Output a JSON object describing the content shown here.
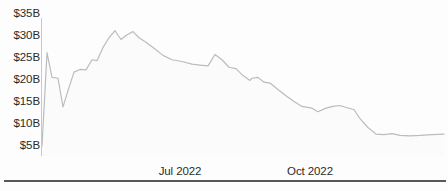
{
  "chart_data": {
    "type": "area",
    "title": "",
    "subtitle": "",
    "xlabel": "",
    "ylabel": "",
    "ylim": [
      5,
      35
    ],
    "yunit": "B",
    "ycurrency": "$",
    "grid": false,
    "legend": null,
    "y_ticks": [
      {
        "label": "$35B",
        "value": 35
      },
      {
        "label": "$30B",
        "value": 30
      },
      {
        "label": "$25B",
        "value": 25
      },
      {
        "label": "$20B",
        "value": 20
      },
      {
        "label": "$15B",
        "value": 15
      },
      {
        "label": "$10B",
        "value": 10
      },
      {
        "label": "$5B",
        "value": 5
      }
    ],
    "x_ticks": [
      {
        "label": "Jul 2022",
        "x_pos": 180
      },
      {
        "label": "Oct 2022",
        "x_pos": 310
      }
    ],
    "series": [
      {
        "name": "value",
        "color": "#b9bcc0",
        "points": [
          {
            "x": 42,
            "y": 5.0
          },
          {
            "x": 47,
            "y": 26.2
          },
          {
            "x": 52,
            "y": 20.6
          },
          {
            "x": 58,
            "y": 20.4
          },
          {
            "x": 63,
            "y": 13.9
          },
          {
            "x": 68,
            "y": 17.6
          },
          {
            "x": 74,
            "y": 21.8
          },
          {
            "x": 80,
            "y": 22.4
          },
          {
            "x": 86,
            "y": 22.3
          },
          {
            "x": 92,
            "y": 24.6
          },
          {
            "x": 97,
            "y": 24.4
          },
          {
            "x": 103,
            "y": 27.4
          },
          {
            "x": 109,
            "y": 29.6
          },
          {
            "x": 115,
            "y": 31.2
          },
          {
            "x": 121,
            "y": 29.2
          },
          {
            "x": 127,
            "y": 30.3
          },
          {
            "x": 133,
            "y": 31.0
          },
          {
            "x": 139,
            "y": 29.6
          },
          {
            "x": 146,
            "y": 28.6
          },
          {
            "x": 154,
            "y": 27.2
          },
          {
            "x": 163,
            "y": 25.6
          },
          {
            "x": 172,
            "y": 24.6
          },
          {
            "x": 182,
            "y": 24.2
          },
          {
            "x": 192,
            "y": 23.6
          },
          {
            "x": 200,
            "y": 23.4
          },
          {
            "x": 208,
            "y": 23.2
          },
          {
            "x": 215,
            "y": 25.8
          },
          {
            "x": 222,
            "y": 24.6
          },
          {
            "x": 229,
            "y": 22.9
          },
          {
            "x": 236,
            "y": 22.6
          },
          {
            "x": 243,
            "y": 21.0
          },
          {
            "x": 250,
            "y": 19.9
          },
          {
            "x": 252,
            "y": 20.4
          },
          {
            "x": 258,
            "y": 20.6
          },
          {
            "x": 264,
            "y": 19.5
          },
          {
            "x": 270,
            "y": 19.3
          },
          {
            "x": 277,
            "y": 18.0
          },
          {
            "x": 285,
            "y": 16.6
          },
          {
            "x": 294,
            "y": 15.1
          },
          {
            "x": 302,
            "y": 14.0
          },
          {
            "x": 312,
            "y": 13.6
          },
          {
            "x": 318,
            "y": 12.8
          },
          {
            "x": 326,
            "y": 13.6
          },
          {
            "x": 333,
            "y": 14.0
          },
          {
            "x": 340,
            "y": 14.2
          },
          {
            "x": 347,
            "y": 13.7
          },
          {
            "x": 354,
            "y": 13.3
          },
          {
            "x": 360,
            "y": 11.2
          },
          {
            "x": 368,
            "y": 9.2
          },
          {
            "x": 376,
            "y": 7.7
          },
          {
            "x": 384,
            "y": 7.6
          },
          {
            "x": 392,
            "y": 7.8
          },
          {
            "x": 400,
            "y": 7.4
          },
          {
            "x": 410,
            "y": 7.3
          },
          {
            "x": 420,
            "y": 7.4
          },
          {
            "x": 432,
            "y": 7.6
          },
          {
            "x": 444,
            "y": 7.7
          }
        ]
      }
    ],
    "colors": {
      "line": "#b9bcc0",
      "fill": "#fbfbfc",
      "axis": "#c9c9c9",
      "text": "#2b2b2b",
      "rule": "#56585c",
      "background": "#fdfdfd"
    },
    "axis_geometry": {
      "plot_left": 42,
      "plot_right": 446,
      "y_top_px": 14,
      "y_bottom_px": 146,
      "y_top_value": 35,
      "y_bottom_value": 5,
      "vline_top": 18,
      "vline_bottom": 156
    }
  }
}
